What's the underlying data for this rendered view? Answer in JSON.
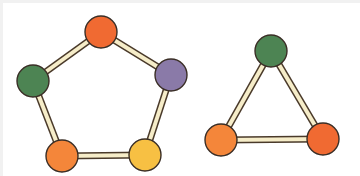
{
  "diagram": {
    "type": "graph",
    "background": "#ffffff",
    "edge_colors": {
      "fill": "#f6edc9",
      "outline": "#4a3a2a"
    },
    "node_outline": "#3a2e26",
    "node_radius": 16,
    "graphs": [
      {
        "name": "pentagon-graph",
        "shape": "cycle",
        "nodes": [
          {
            "id": "p1",
            "color_name": "orange-red",
            "color": "#f06a32",
            "cx": 101,
            "cy": 32
          },
          {
            "id": "p2",
            "color_name": "purple",
            "color": "#8a7aa8",
            "cx": 171,
            "cy": 75
          },
          {
            "id": "p3",
            "color_name": "yellow",
            "color": "#f7c043",
            "cx": 145,
            "cy": 155
          },
          {
            "id": "p4",
            "color_name": "orange",
            "color": "#f4863a",
            "cx": 62,
            "cy": 156
          },
          {
            "id": "p5",
            "color_name": "green",
            "color": "#4d8453",
            "cx": 33,
            "cy": 81
          }
        ],
        "edges": [
          [
            "p1",
            "p2"
          ],
          [
            "p2",
            "p3"
          ],
          [
            "p3",
            "p4"
          ],
          [
            "p4",
            "p5"
          ],
          [
            "p5",
            "p1"
          ]
        ]
      },
      {
        "name": "triangle-graph",
        "shape": "cycle",
        "nodes": [
          {
            "id": "t1",
            "color_name": "green",
            "color": "#4d8453",
            "cx": 271,
            "cy": 51
          },
          {
            "id": "t2",
            "color_name": "orange-red",
            "color": "#f06a32",
            "cx": 323,
            "cy": 139
          },
          {
            "id": "t3",
            "color_name": "orange",
            "color": "#f4863a",
            "cx": 221,
            "cy": 140
          }
        ],
        "edges": [
          [
            "t1",
            "t2"
          ],
          [
            "t2",
            "t3"
          ],
          [
            "t3",
            "t1"
          ]
        ]
      }
    ]
  }
}
